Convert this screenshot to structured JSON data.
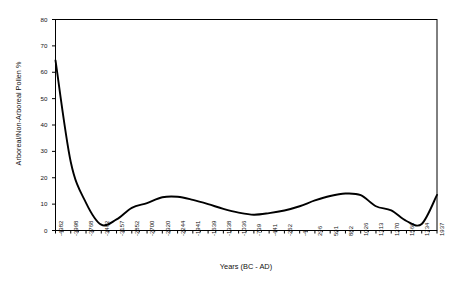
{
  "chart_data": {
    "type": "line",
    "title": "",
    "xlabel": "Years (BC - AD)",
    "ylabel": "Arboreal/Non-Arboreal Pollen %",
    "ylim": [
      0,
      80
    ],
    "yticks": [
      0,
      10,
      20,
      30,
      40,
      50,
      60,
      70,
      80
    ],
    "grid": false,
    "legend": null,
    "xtick_labels": [
      "-4382",
      "-3998",
      "-3768",
      "-3462",
      "-3157",
      "-2852",
      "-2700",
      "-2320",
      "-2244",
      "-1941",
      "-1639",
      "-1338",
      "-1036",
      "-739",
      "-441",
      "-262",
      "-4",
      "296",
      "591",
      "882",
      "1026",
      "1313",
      "1370",
      "1566",
      "1734",
      "1937"
    ],
    "categories": [
      "-4382",
      "-3998",
      "-3768",
      "-3462",
      "-3157",
      "-2852",
      "-2700",
      "-2320",
      "-2244",
      "-1941",
      "-1639",
      "-1338",
      "-1036",
      "-739",
      "-441",
      "-262",
      "-4",
      "296",
      "591",
      "882",
      "1026",
      "1313",
      "1370",
      "1566",
      "1734",
      "1937"
    ],
    "series": [
      {
        "name": "Arboreal/Non-Arboreal Pollen %",
        "color": "#000000",
        "values": [
          64.5,
          26.0,
          10.5,
          2.2,
          4.2,
          8.6,
          10.4,
          12.6,
          12.8,
          11.6,
          10.0,
          8.2,
          6.8,
          6.0,
          6.6,
          7.6,
          9.2,
          11.4,
          13.1,
          14.0,
          13.4,
          9.2,
          7.6,
          3.6,
          2.5,
          13.5
        ]
      }
    ],
    "annotations": []
  },
  "axes": {
    "y_title": "Arboreal/Non-Arboreal Pollen %",
    "x_title": "Years (BC - AD)"
  },
  "style": {
    "line_color": "#000000",
    "frame_color": "#000000",
    "background": "#ffffff"
  }
}
